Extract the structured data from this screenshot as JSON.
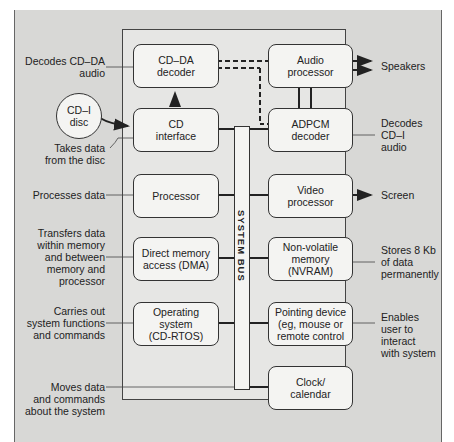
{
  "diagram": {
    "title": "",
    "bus_label": "SYSTEM BUS",
    "external": {
      "disc": "CD–I\ndisc",
      "speakers": "Speakers",
      "screen": "Screen"
    },
    "components": [
      {
        "id": "cdda",
        "label": "CD–DA\ndecoder",
        "description": "Decodes CD–DA\naudio"
      },
      {
        "id": "cdif",
        "label": "CD\ninterface",
        "description": "Takes data\nfrom the disc"
      },
      {
        "id": "cpu",
        "label": "Processor",
        "description": "Processes data"
      },
      {
        "id": "dma",
        "label": "Direct memory\naccess (DMA)",
        "description": "Transfers data\nwithin memory\nand between\nmemory and\nprocessor"
      },
      {
        "id": "os",
        "label": "Operating\nsystem\n(CD-RTOS)",
        "description": "Carries out\nsystem functions\nand commands"
      },
      {
        "id": "audio",
        "label": "Audio\nprocessor",
        "description": ""
      },
      {
        "id": "adpcm",
        "label": "ADPCM\ndecoder",
        "description": "Decodes\nCD–I\naudio"
      },
      {
        "id": "video",
        "label": "Video\nprocessor",
        "description": ""
      },
      {
        "id": "nvram",
        "label": "Non-volatile\nmemory\n(NVRAM)",
        "description": "Stores 8 Kb\nof data\npermanently"
      },
      {
        "id": "pointing",
        "label": "Pointing device\n(eg, mouse or\nremote control",
        "description": "Enables\nuser to\ninteract\nwith system"
      },
      {
        "id": "clock",
        "label": "Clock/\ncalendar",
        "description": ""
      }
    ],
    "bus_description": "Moves data\nand commands\nabout the system"
  }
}
